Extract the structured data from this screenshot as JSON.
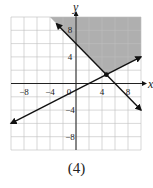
{
  "chart_data": {
    "type": "line",
    "title": "",
    "caption": "(4)",
    "xlabel": "x",
    "ylabel": "y",
    "xlim": [
      -10,
      10
    ],
    "ylim": [
      -10,
      10
    ],
    "grid": true,
    "grid_step": 2,
    "x_ticks": [
      -8,
      -4,
      0,
      4,
      8
    ],
    "y_ticks": [
      8,
      4,
      -4,
      -8
    ],
    "x_tick_labels": [
      "−8",
      "−4",
      "0",
      "4",
      "8"
    ],
    "y_tick_labels": [
      "8",
      "4",
      "−4",
      "−8"
    ],
    "series": [
      {
        "name": "y = -x + 6",
        "slope": -1,
        "intercept": 6,
        "x": [
          -3,
          10
        ],
        "y": [
          9,
          -4
        ],
        "color": "#111111"
      },
      {
        "name": "y = 0.5x - 1",
        "slope": 0.5,
        "intercept": -1,
        "x": [
          -10,
          10
        ],
        "y": [
          -6,
          4
        ],
        "color": "#111111"
      }
    ],
    "intersection_point": {
      "x": 4.67,
      "y": 1.33
    },
    "shaded_region": {
      "description": "y >= -x + 6 and y >= 0.5x - 1",
      "color": "#a6a6a6"
    }
  }
}
